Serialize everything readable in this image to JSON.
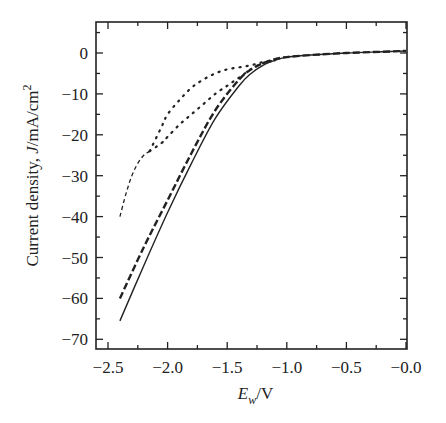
{
  "chart_data": {
    "type": "line",
    "title": "",
    "xlabel": "E_w/V",
    "xlabel_main": "E",
    "xlabel_sub": "w",
    "xlabel_unit": "/V",
    "ylabel": "Current density, J/mA/cm²",
    "ylabel_prefix": "Current density, ",
    "ylabel_var": "J",
    "ylabel_unit": "/mA/cm",
    "ylabel_sup": "2",
    "xlim": [
      -2.5,
      0.0
    ],
    "ylim": [
      -72,
      7
    ],
    "x_ticks": [
      -2.5,
      -2.0,
      -1.5,
      -1.0,
      -0.5,
      0.0
    ],
    "x_tick_labels": [
      "−2.5",
      "−2.0",
      "−1.5",
      "−1.0",
      "−0.5",
      "−0.0"
    ],
    "y_ticks": [
      0,
      -10,
      -20,
      -30,
      -40,
      -50,
      -60,
      -70
    ],
    "y_tick_labels": [
      "0",
      "−10",
      "−20",
      "−30",
      "−40",
      "−50",
      "−60",
      "−70"
    ],
    "grid": false,
    "legend": "none",
    "series": [
      {
        "name": "solid",
        "style": "solid",
        "x": [
          -2.4,
          -2.2,
          -2.0,
          -1.8,
          -1.6,
          -1.4,
          -1.3,
          -1.2,
          -1.1,
          -1.0,
          -0.8,
          -0.5,
          -0.2,
          0.0
        ],
        "y": [
          -65.5,
          -52,
          -39,
          -27,
          -16,
          -8,
          -5,
          -3,
          -1.8,
          -1,
          -0.5,
          0,
          0.3,
          0.5
        ]
      },
      {
        "name": "long-dashed",
        "style": "long-dash",
        "x": [
          -2.4,
          -2.2,
          -2.0,
          -1.8,
          -1.6,
          -1.4,
          -1.3,
          -1.2,
          -1.1,
          -1.0,
          -0.8,
          -0.5,
          -0.2,
          0.0
        ],
        "y": [
          -60,
          -47.5,
          -36,
          -24.5,
          -14,
          -6.5,
          -4,
          -2.5,
          -1.5,
          -1,
          -0.5,
          0,
          0.3,
          0.5
        ]
      },
      {
        "name": "dotted-upper",
        "style": "dotted",
        "x": [
          -2.15,
          -2.05,
          -2.0,
          -1.9,
          -1.8,
          -1.7,
          -1.6,
          -1.5,
          -1.4,
          -1.3,
          -1.2,
          -1.1
        ],
        "y": [
          -24,
          -18,
          -15,
          -11.5,
          -8.5,
          -6.5,
          -5,
          -4,
          -3.5,
          -3,
          -2.2,
          -1.8
        ]
      },
      {
        "name": "dotted-lower",
        "style": "dotted",
        "x": [
          -2.15,
          -2.05,
          -2.0,
          -1.9,
          -1.8,
          -1.7,
          -1.6,
          -1.5,
          -1.4,
          -1.3,
          -1.2,
          -1.1
        ],
        "y": [
          -24,
          -22,
          -20.5,
          -17.5,
          -15,
          -12.5,
          -10,
          -8,
          -6,
          -4,
          -2.5,
          -1.8
        ]
      },
      {
        "name": "short-dashed",
        "style": "short-dash",
        "x": [
          -2.4,
          -2.35,
          -2.3,
          -2.25,
          -2.2,
          -2.15
        ],
        "y": [
          -40,
          -34.5,
          -30,
          -27,
          -25,
          -24
        ]
      }
    ]
  },
  "layout": {
    "plot_left": 96,
    "plot_top": 22,
    "plot_right": 407,
    "plot_bottom": 349,
    "y0_px": 53,
    "px_per_unit_y": 4.09,
    "x0_px": 406,
    "px_per_unit_x": 119.2,
    "line_color": "#222222",
    "bg_color": "#ffffff"
  }
}
